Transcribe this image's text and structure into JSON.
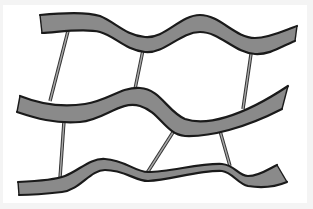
{
  "diagram": {
    "colors": {
      "background": "#ffffff",
      "ribbon_fill": "#8a8a8a",
      "ribbon_edge": "#1a1a1a",
      "rod": "#a9a9a9"
    },
    "ribbons": [
      {
        "id": "ribbon-top",
        "position": "top"
      },
      {
        "id": "ribbon-middle",
        "position": "middle"
      },
      {
        "id": "ribbon-bottom",
        "position": "bottom"
      }
    ],
    "rods": [
      {
        "id": "rod-1",
        "connects": [
          "ribbon-top",
          "ribbon-middle"
        ]
      },
      {
        "id": "rod-2",
        "connects": [
          "ribbon-top",
          "ribbon-middle"
        ]
      },
      {
        "id": "rod-3",
        "connects": [
          "ribbon-top",
          "ribbon-middle"
        ]
      },
      {
        "id": "rod-4",
        "connects": [
          "ribbon-middle",
          "ribbon-bottom"
        ]
      },
      {
        "id": "rod-5",
        "connects": [
          "ribbon-middle",
          "ribbon-bottom"
        ]
      },
      {
        "id": "rod-6",
        "connects": [
          "ribbon-middle",
          "ribbon-bottom"
        ]
      }
    ]
  }
}
